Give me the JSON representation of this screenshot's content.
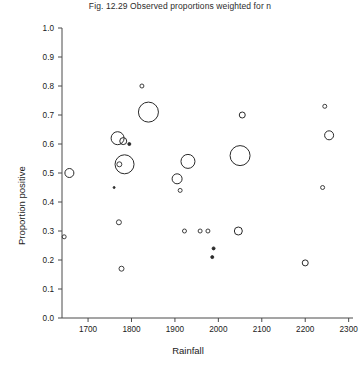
{
  "figure": {
    "title": "Fig. 12.29 Observed proportions weighted for n"
  },
  "chart_data": {
    "type": "scatter",
    "title": "Fig. 12.29 Observed proportions weighted for n",
    "xlabel": "Rainfall",
    "ylabel": "Proportion positive",
    "xlim": [
      1640,
      2310
    ],
    "ylim": [
      0.0,
      1.0
    ],
    "grid": false,
    "legend": null,
    "note": "Marker area is proportional to the weight n of each observation; markers are drawn as open circles.",
    "xticks": [
      1700,
      1800,
      1900,
      2000,
      2100,
      2200,
      2300
    ],
    "xtick_labels": [
      "1700",
      "1800",
      "1900",
      "2000",
      "2100",
      "2200",
      "2300"
    ],
    "yticks": [
      0.0,
      0.1,
      0.2,
      0.3,
      0.4,
      0.5,
      0.6,
      0.7,
      0.8,
      0.9,
      1.0
    ],
    "ytick_labels": [
      "0.0",
      "0.1",
      "0.2",
      "0.3",
      "0.4",
      "0.5",
      "0.6",
      "0.7",
      "0.8",
      "0.9",
      "1.0"
    ],
    "marker_color": "#2a2a2a",
    "points": [
      {
        "x": 1645,
        "y": 0.28,
        "size": 4
      },
      {
        "x": 1657,
        "y": 0.5,
        "size": 9
      },
      {
        "x": 1768,
        "y": 0.62,
        "size": 13
      },
      {
        "x": 1781,
        "y": 0.61,
        "size": 7
      },
      {
        "x": 1795,
        "y": 0.6,
        "size": 3
      },
      {
        "x": 1772,
        "y": 0.53,
        "size": 5
      },
      {
        "x": 1784,
        "y": 0.53,
        "size": 19
      },
      {
        "x": 1760,
        "y": 0.45,
        "size": 2
      },
      {
        "x": 1771,
        "y": 0.33,
        "size": 5
      },
      {
        "x": 1777,
        "y": 0.17,
        "size": 5
      },
      {
        "x": 1824,
        "y": 0.8,
        "size": 4
      },
      {
        "x": 1839,
        "y": 0.71,
        "size": 20
      },
      {
        "x": 1905,
        "y": 0.48,
        "size": 10
      },
      {
        "x": 1930,
        "y": 0.54,
        "size": 14
      },
      {
        "x": 1912,
        "y": 0.44,
        "size": 4
      },
      {
        "x": 1922,
        "y": 0.3,
        "size": 4
      },
      {
        "x": 1958,
        "y": 0.3,
        "size": 4
      },
      {
        "x": 1976,
        "y": 0.3,
        "size": 4
      },
      {
        "x": 1989,
        "y": 0.24,
        "size": 3
      },
      {
        "x": 1986,
        "y": 0.21,
        "size": 3
      },
      {
        "x": 2050,
        "y": 0.56,
        "size": 20
      },
      {
        "x": 2055,
        "y": 0.7,
        "size": 6
      },
      {
        "x": 2046,
        "y": 0.3,
        "size": 8
      },
      {
        "x": 2200,
        "y": 0.19,
        "size": 6
      },
      {
        "x": 2245,
        "y": 0.73,
        "size": 4
      },
      {
        "x": 2255,
        "y": 0.63,
        "size": 9
      },
      {
        "x": 2240,
        "y": 0.45,
        "size": 4
      }
    ]
  }
}
